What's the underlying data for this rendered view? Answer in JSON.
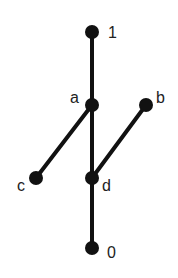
{
  "diagram": {
    "type": "hasse-diagram",
    "colors": {
      "node": "#111111",
      "edge": "#111111",
      "label": "#222222",
      "background": "#ffffff"
    },
    "nodes": [
      {
        "id": "1",
        "label": "1",
        "x": 92,
        "y": 32,
        "lx": 108,
        "ly": 38
      },
      {
        "id": "a",
        "label": "a",
        "x": 92,
        "y": 105,
        "lx": 70,
        "ly": 103
      },
      {
        "id": "b",
        "label": "b",
        "x": 146,
        "y": 105,
        "lx": 156,
        "ly": 103
      },
      {
        "id": "c",
        "label": "c",
        "x": 36,
        "y": 178,
        "lx": 17,
        "ly": 191
      },
      {
        "id": "d",
        "label": "d",
        "x": 92,
        "y": 178,
        "lx": 102,
        "ly": 191
      },
      {
        "id": "0",
        "label": "0",
        "x": 92,
        "y": 248,
        "lx": 107,
        "ly": 258
      }
    ],
    "edges": [
      {
        "from": "1",
        "to": "a"
      },
      {
        "from": "a",
        "to": "d"
      },
      {
        "from": "d",
        "to": "0"
      },
      {
        "from": "a",
        "to": "c"
      },
      {
        "from": "b",
        "to": "d"
      }
    ]
  }
}
